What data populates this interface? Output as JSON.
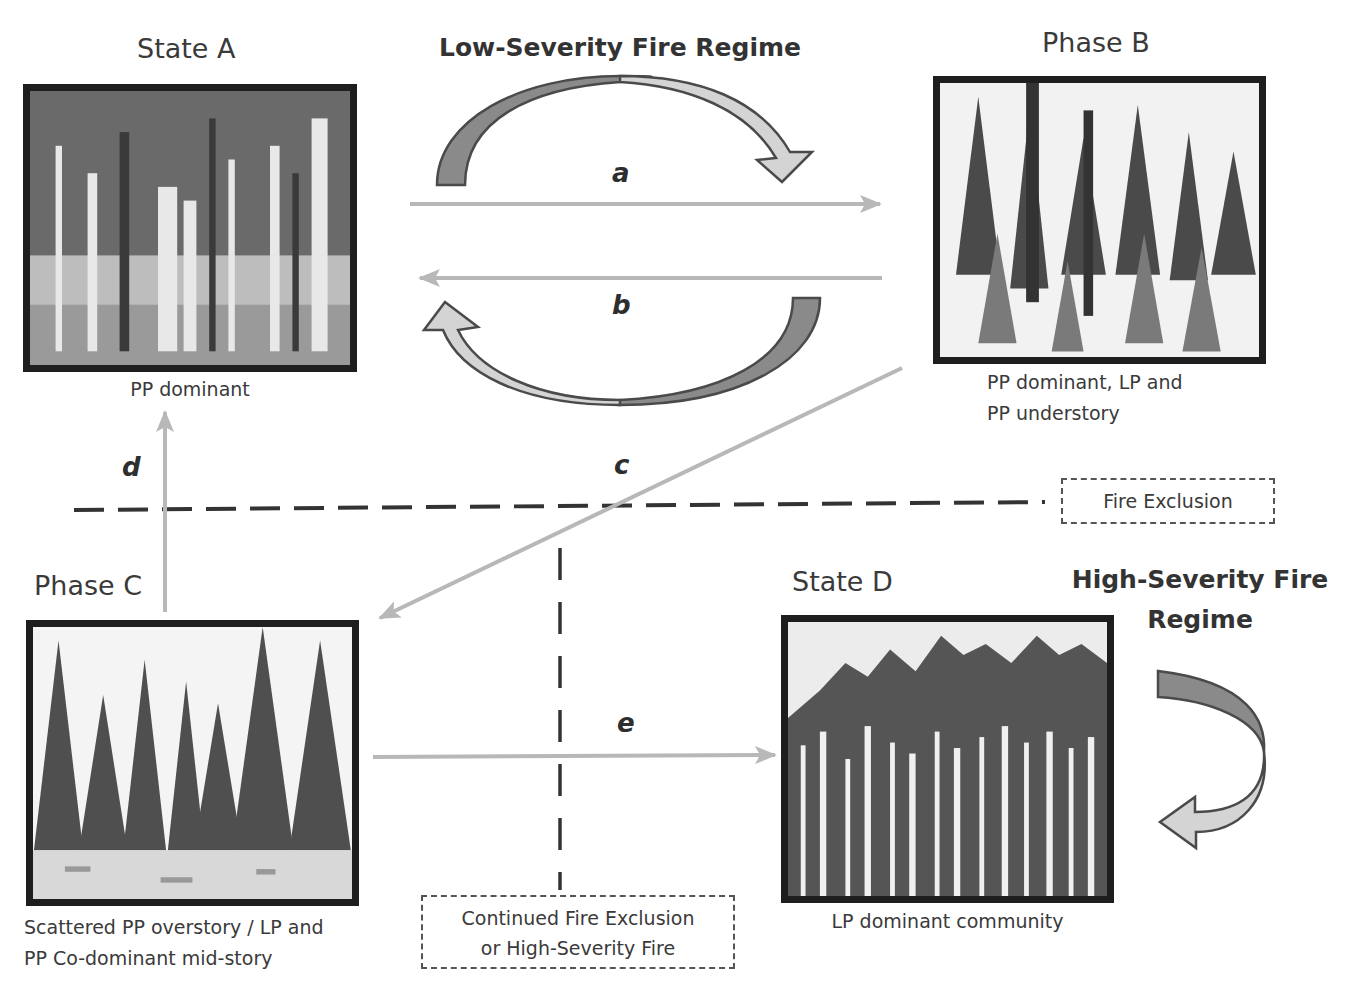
{
  "diagram": {
    "low_severity_regime": "Low-Severity Fire Regime",
    "high_severity_regime": [
      "High-Severity Fire",
      "Regime"
    ],
    "nodes": {
      "state_a": {
        "title": "State A",
        "caption": [
          "PP dominant"
        ]
      },
      "phase_b": {
        "title": "Phase B",
        "caption": [
          "PP dominant, LP and",
          "PP understory"
        ]
      },
      "phase_c": {
        "title": "Phase C",
        "caption": [
          "Scattered PP overstory / LP and",
          "PP Co-dominant mid-story"
        ]
      },
      "state_d": {
        "title": "State D",
        "caption": [
          "LP dominant community"
        ]
      }
    },
    "transitions": {
      "a": "a",
      "b": "b",
      "c": "c",
      "d": "d",
      "e": "e"
    },
    "thresholds": {
      "fire_exclusion": "Fire Exclusion",
      "continued": [
        "Continued Fire Exclusion",
        "or High-Severity Fire"
      ]
    },
    "colors": {
      "transition_arrow": "#b8b8b8",
      "curved_arrow_dark": "#8a8a8a",
      "curved_arrow_light": "#d4d4d4",
      "outline": "#4a4a4a",
      "threshold_line": "#333333",
      "photo_border": "#1e1e1e"
    }
  }
}
